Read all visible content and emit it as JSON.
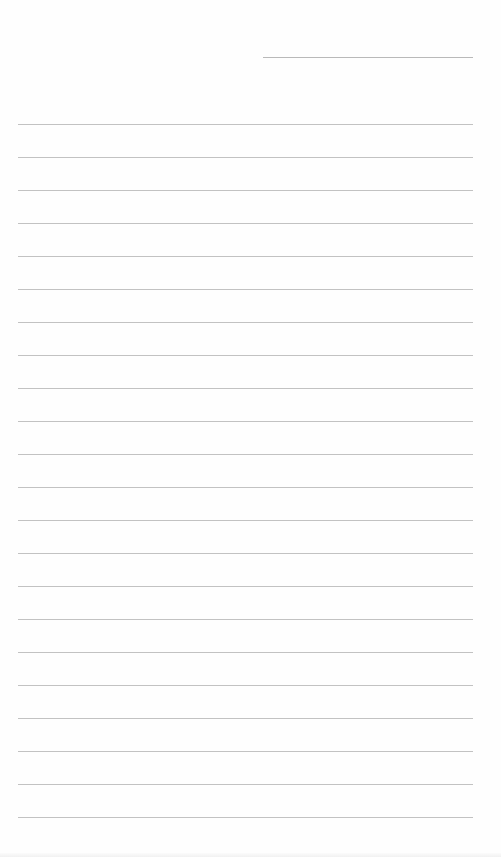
{
  "document": {
    "type": "lined-paper",
    "header_line": {
      "x": 263,
      "y": 57,
      "width": 210
    },
    "rules": {
      "count": 22,
      "start_y": 124,
      "spacing": 33,
      "left": 18,
      "width": 455
    },
    "text": []
  }
}
